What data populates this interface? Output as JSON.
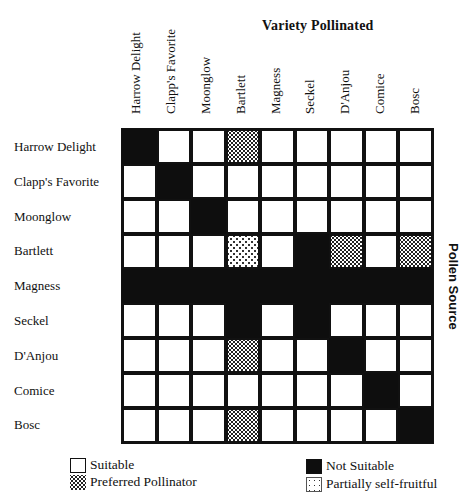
{
  "title": "Variety Pollinated",
  "side_label": "Pollen Source",
  "columns": [
    "Harrow Delight",
    "Clapp's Favorite",
    "Moonglow",
    "Bartlett",
    "Magness",
    "Seckel",
    "D'Anjou",
    "Comice",
    "Bosc"
  ],
  "rows": [
    "Harrow Delight",
    "Clapp's Favorite",
    "Moonglow",
    "Bartlett",
    "Magness",
    "Seckel",
    "D'Anjou",
    "Comice",
    "Bosc"
  ],
  "legend": {
    "S": "Suitable",
    "P": "Preferred Pollinator",
    "N": "Not Suitable",
    "F": "Partially self-fruitful"
  },
  "matrix": [
    [
      "N",
      "S",
      "S",
      "P",
      "S",
      "S",
      "S",
      "S",
      "S"
    ],
    [
      "S",
      "N",
      "S",
      "S",
      "S",
      "S",
      "S",
      "S",
      "S"
    ],
    [
      "S",
      "S",
      "N",
      "S",
      "S",
      "S",
      "S",
      "S",
      "S"
    ],
    [
      "S",
      "S",
      "S",
      "F",
      "S",
      "N",
      "P",
      "S",
      "P"
    ],
    [
      "N",
      "N",
      "N",
      "N",
      "N",
      "N",
      "N",
      "N",
      "N"
    ],
    [
      "S",
      "S",
      "S",
      "N",
      "S",
      "N",
      "S",
      "S",
      "S"
    ],
    [
      "S",
      "S",
      "S",
      "P",
      "S",
      "S",
      "N",
      "S",
      "S"
    ],
    [
      "S",
      "S",
      "S",
      "S",
      "S",
      "S",
      "S",
      "N",
      "S"
    ],
    [
      "S",
      "S",
      "S",
      "P",
      "S",
      "S",
      "S",
      "S",
      "N"
    ]
  ]
}
